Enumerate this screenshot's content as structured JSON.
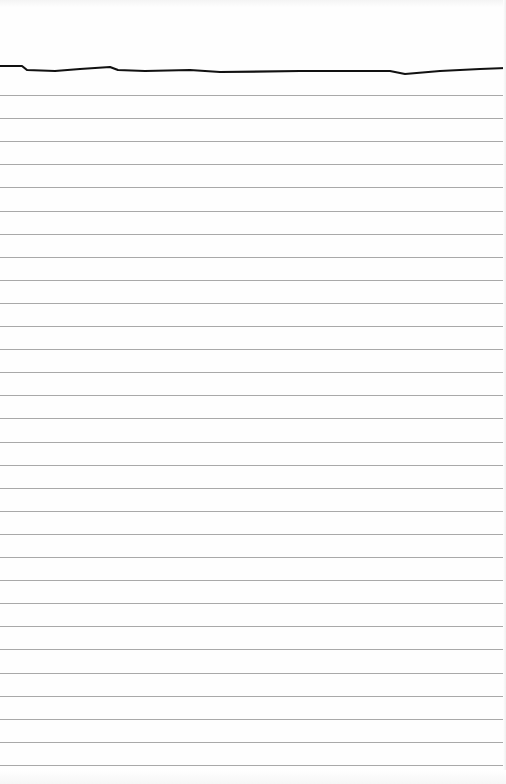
{
  "page": {
    "type": "lined-notebook-paper",
    "background_color": "#ffffff",
    "rule_color": "#a9a9a9",
    "edge_color": "#111111"
  },
  "rules": {
    "count": 30,
    "first_y": 95,
    "spacing": 23.1
  },
  "tear_edge": {
    "points": [
      [
        0,
        66
      ],
      [
        22,
        66
      ],
      [
        27,
        70
      ],
      [
        55,
        71
      ],
      [
        80,
        69
      ],
      [
        110,
        67
      ],
      [
        118,
        70
      ],
      [
        145,
        71
      ],
      [
        190,
        70
      ],
      [
        220,
        72
      ],
      [
        300,
        71
      ],
      [
        390,
        71
      ],
      [
        405,
        74
      ],
      [
        440,
        71
      ],
      [
        480,
        69
      ],
      [
        506,
        68
      ]
    ]
  }
}
